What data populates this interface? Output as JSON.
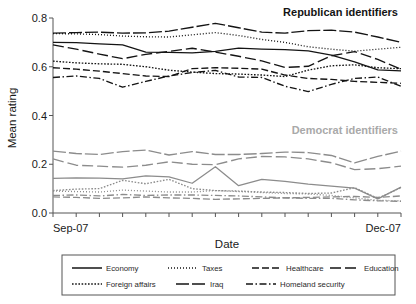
{
  "chart_data": {
    "type": "line",
    "title": "",
    "xlabel": "Date",
    "ylabel": "Mean rating",
    "xlim": [
      0,
      15
    ],
    "ylim": [
      0.0,
      0.8
    ],
    "yticks": [
      0.0,
      0.2,
      0.4,
      0.6,
      0.8
    ],
    "ytick_labels": [
      "0.0",
      "0.2",
      "0.4",
      "0.6",
      "0.8"
    ],
    "xtick_count": 16,
    "xtick_labels_shown": [
      "Sep-07",
      "Dec-07"
    ],
    "grid": false,
    "legend_position": "below-plot",
    "annotations": [
      {
        "text": "Republican identifiers",
        "group": "republican",
        "color": "#141414"
      },
      {
        "text": "Democrat identifiers",
        "group": "democrat",
        "color": "#a9a9a9"
      }
    ],
    "x": [
      0,
      1,
      2,
      3,
      4,
      5,
      6,
      7,
      8,
      9,
      10,
      11,
      12,
      13,
      14,
      15
    ],
    "groups": [
      {
        "name": "Republican identifiers",
        "color": "#141414",
        "series": [
          {
            "name": "Economy",
            "dash": "solid",
            "values": [
              0.7,
              0.699,
              0.694,
              0.69,
              0.66,
              0.659,
              0.657,
              0.663,
              0.676,
              0.672,
              0.67,
              0.665,
              0.648,
              0.62,
              0.587,
              0.583
            ]
          },
          {
            "name": "Taxes",
            "dash": "dotted-fine",
            "values": [
              0.736,
              0.735,
              0.732,
              0.726,
              0.723,
              0.722,
              0.731,
              0.74,
              0.728,
              0.712,
              0.7,
              0.682,
              0.672,
              0.664,
              0.672,
              0.68
            ]
          },
          {
            "name": "Healthcare",
            "dash": "dash-long",
            "values": [
              0.596,
              0.59,
              0.582,
              0.572,
              0.562,
              0.56,
              0.592,
              0.596,
              0.594,
              0.59,
              0.566,
              0.552,
              0.548,
              0.54,
              0.536,
              0.532
            ]
          },
          {
            "name": "Education",
            "dash": "dash-xlong",
            "values": [
              0.69,
              0.672,
              0.652,
              0.633,
              0.651,
              0.663,
              0.676,
              0.66,
              0.643,
              0.624,
              0.597,
              0.602,
              0.645,
              0.662,
              0.63,
              0.59
            ]
          },
          {
            "name": "Foreign affairs",
            "dash": "dotted-sq",
            "values": [
              0.623,
              0.616,
              0.612,
              0.61,
              0.6,
              0.586,
              0.578,
              0.572,
              0.57,
              0.566,
              0.56,
              0.586,
              0.604,
              0.608,
              0.596,
              0.592
            ]
          },
          {
            "name": "Iraq",
            "dash": "dash-solidlong",
            "values": [
              0.738,
              0.74,
              0.742,
              0.738,
              0.739,
              0.746,
              0.762,
              0.778,
              0.76,
              0.742,
              0.738,
              0.748,
              0.75,
              0.742,
              0.722,
              0.7
            ]
          },
          {
            "name": "Homeland security",
            "dash": "dashdot",
            "values": [
              0.556,
              0.562,
              0.552,
              0.516,
              0.54,
              0.562,
              0.576,
              0.585,
              0.558,
              0.556,
              0.52,
              0.498,
              0.528,
              0.552,
              0.558,
              0.52
            ]
          }
        ]
      },
      {
        "name": "Democrat identifiers",
        "color": "#8c8c8c",
        "series": [
          {
            "name": "Economy",
            "dash": "solid",
            "values": [
              0.142,
              0.144,
              0.143,
              0.14,
              0.152,
              0.148,
              0.122,
              0.19,
              0.112,
              0.138,
              0.13,
              0.118,
              0.11,
              0.102,
              0.058,
              0.106
            ]
          },
          {
            "name": "Taxes",
            "dash": "dotted-fine",
            "values": [
              0.09,
              0.088,
              0.086,
              0.094,
              0.09,
              0.086,
              0.086,
              0.092,
              0.088,
              0.084,
              0.08,
              0.078,
              0.072,
              0.062,
              0.052,
              0.05
            ]
          },
          {
            "name": "Healthcare",
            "dash": "dash-long",
            "values": [
              0.066,
              0.064,
              0.06,
              0.062,
              0.066,
              0.062,
              0.06,
              0.056,
              0.058,
              0.06,
              0.062,
              0.064,
              0.066,
              0.068,
              0.064,
              0.07
            ]
          },
          {
            "name": "Education",
            "dash": "dash-xlong",
            "values": [
              0.222,
              0.196,
              0.192,
              0.188,
              0.196,
              0.21,
              0.2,
              0.198,
              0.222,
              0.232,
              0.23,
              0.222,
              0.206,
              0.178,
              0.182,
              0.192
            ]
          },
          {
            "name": "Foreign affairs",
            "dash": "dotted-sq",
            "values": [
              0.092,
              0.098,
              0.1,
              0.134,
              0.12,
              0.138,
              0.1,
              0.092,
              0.09,
              0.086,
              0.084,
              0.08,
              0.082,
              0.104,
              0.06,
              0.104
            ]
          },
          {
            "name": "Iraq",
            "dash": "dash-solidlong",
            "values": [
              0.254,
              0.244,
              0.24,
              0.252,
              0.258,
              0.238,
              0.252,
              0.24,
              0.24,
              0.244,
              0.25,
              0.248,
              0.236,
              0.206,
              0.232,
              0.254
            ]
          },
          {
            "name": "Homeland security",
            "dash": "dashdot",
            "values": [
              0.072,
              0.074,
              0.07,
              0.076,
              0.072,
              0.074,
              0.074,
              0.072,
              0.07,
              0.066,
              0.062,
              0.06,
              0.06,
              0.054,
              0.05,
              0.048
            ]
          }
        ]
      }
    ]
  },
  "axis": {
    "ylabel": "Mean rating",
    "xlabel": "Date",
    "ytick0": "0.0",
    "ytick1": "0.2",
    "ytick2": "0.4",
    "ytick3": "0.6",
    "ytick4": "0.8",
    "xtick_left": "Sep-07",
    "xtick_right": "Dec-07"
  },
  "annotations": {
    "republican": "Republican identifiers",
    "democrat": "Democrat identifiers"
  },
  "legend": {
    "row1": [
      {
        "label": "Economy",
        "style": "solid"
      },
      {
        "label": "Taxes",
        "style": "dotted-fine"
      },
      {
        "label": "Healthcare",
        "style": "dash-long"
      },
      {
        "label": "Education",
        "style": "dash-xlong"
      }
    ],
    "row2": [
      {
        "label": "Foreign affairs",
        "style": "dotted-sq"
      },
      {
        "label": "Iraq",
        "style": "dash-solidlong"
      },
      {
        "label": "Homeland security",
        "style": "dashdot"
      }
    ]
  },
  "colors": {
    "republican": "#141414",
    "democrat": "#8c8c8c",
    "axis": "#555555",
    "text": "#1a1a1a"
  }
}
